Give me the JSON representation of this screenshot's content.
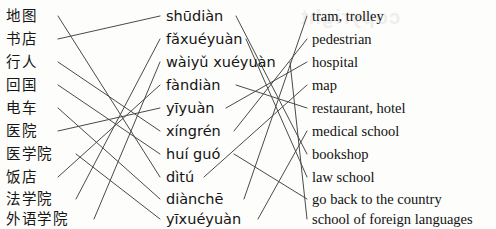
{
  "exercise": {
    "title": "Vocabulary matching exercise",
    "watermark_text": "copyright"
  },
  "columns": {
    "hanzi": {
      "name": "chinese-characters-column",
      "items": [
        {
          "id": "ditu",
          "label": "地图"
        },
        {
          "id": "shudian",
          "label": "书店"
        },
        {
          "id": "xingren",
          "label": "行人"
        },
        {
          "id": "huiguo",
          "label": "回国"
        },
        {
          "id": "dianche",
          "label": "电车"
        },
        {
          "id": "yiyuan",
          "label": "医院"
        },
        {
          "id": "yixueyuan",
          "label": "医学院"
        },
        {
          "id": "fandian",
          "label": "饭店"
        },
        {
          "id": "faxueyuan",
          "label": "法学院"
        },
        {
          "id": "waiyuxueyuan",
          "label": "外语学院"
        }
      ]
    },
    "pinyin": {
      "name": "pinyin-column",
      "items": [
        {
          "id": "shudian",
          "label": "shūdiàn"
        },
        {
          "id": "faxueyuan",
          "label": "fǎxuéyuàn"
        },
        {
          "id": "waiyuxueyuan",
          "label": "wàiyǔ xuéyuàn"
        },
        {
          "id": "fandian",
          "label": "fàndiàn"
        },
        {
          "id": "yiyuan",
          "label": "yīyuàn"
        },
        {
          "id": "xingren",
          "label": "xíngrén"
        },
        {
          "id": "huiguo",
          "label": "huí guó"
        },
        {
          "id": "ditu",
          "label": "dìtú"
        },
        {
          "id": "dianche",
          "label": "diànchē"
        },
        {
          "id": "yixueyuan",
          "label": "yīxuéyuàn"
        }
      ]
    },
    "english": {
      "name": "english-column",
      "items": [
        {
          "id": "dianche",
          "label": "tram, trolley"
        },
        {
          "id": "xingren",
          "label": "pedestrian"
        },
        {
          "id": "yiyuan",
          "label": "hospital"
        },
        {
          "id": "ditu",
          "label": "map"
        },
        {
          "id": "fandian",
          "label": "restaurant, hotel"
        },
        {
          "id": "yixueyuan",
          "label": "medical school"
        },
        {
          "id": "shudian",
          "label": "bookshop"
        },
        {
          "id": "faxueyuan",
          "label": "law school"
        },
        {
          "id": "huiguo",
          "label": "go back to the country"
        },
        {
          "id": "waiyuxueyuan",
          "label": "school of foreign languages"
        }
      ]
    }
  },
  "connections": {
    "stroke_color": "#4a4a4a",
    "stroke_width": 1,
    "hanzi_to_pinyin": [
      {
        "from": "ditu",
        "from_row": 0,
        "to_row": 7
      },
      {
        "from": "shudian",
        "from_row": 1,
        "to_row": 0
      },
      {
        "from": "xingren",
        "from_row": 2,
        "to_row": 5
      },
      {
        "from": "huiguo",
        "from_row": 3,
        "to_row": 6
      },
      {
        "from": "dianche",
        "from_row": 4,
        "to_row": 8
      },
      {
        "from": "yiyuan",
        "from_row": 5,
        "to_row": 4
      },
      {
        "from": "yixueyuan",
        "from_row": 6,
        "to_row": 9
      },
      {
        "from": "fandian",
        "from_row": 7,
        "to_row": 3
      },
      {
        "from": "faxueyuan",
        "from_row": 8,
        "to_row": 1
      },
      {
        "from": "waiyuxueyuan",
        "from_row": 9,
        "to_row": 2
      }
    ],
    "pinyin_to_english": [
      {
        "from": "shudian",
        "from_row": 0,
        "to_row": 6
      },
      {
        "from": "faxueyuan",
        "from_row": 1,
        "to_row": 7
      },
      {
        "from": "waiyuxueyuan",
        "from_row": 2,
        "to_row": 9
      },
      {
        "from": "fandian",
        "from_row": 3,
        "to_row": 4
      },
      {
        "from": "yiyuan",
        "from_row": 4,
        "to_row": 2
      },
      {
        "from": "xingren",
        "from_row": 5,
        "to_row": 1
      },
      {
        "from": "huiguo",
        "from_row": 6,
        "to_row": 8
      },
      {
        "from": "ditu",
        "from_row": 7,
        "to_row": 3
      },
      {
        "from": "dianche",
        "from_row": 8,
        "to_row": 0
      },
      {
        "from": "yixueyuan",
        "from_row": 9,
        "to_row": 5
      }
    ]
  }
}
